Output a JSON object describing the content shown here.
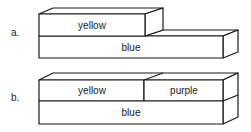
{
  "diagrams": [
    {
      "label": "a.",
      "blocks": {
        "top_left": "yellow",
        "bottom": "blue"
      }
    },
    {
      "label": "b.",
      "blocks": {
        "top_left": "yellow",
        "top_right": "purple",
        "bottom": "blue"
      }
    }
  ],
  "colors": {
    "stroke": "#1a1a1a",
    "fill": "#ffffff"
  }
}
